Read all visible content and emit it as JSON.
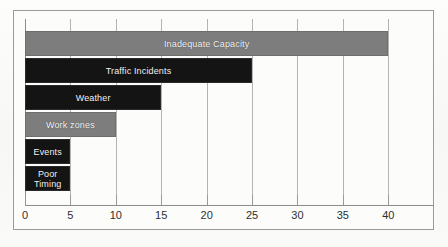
{
  "chart_data": {
    "type": "bar",
    "orientation": "horizontal",
    "title": "",
    "xlabel": "",
    "ylabel": "",
    "xlim": [
      0,
      42.5
    ],
    "grid": true,
    "legend": "none",
    "xticks": [
      "0",
      "5",
      "10",
      "15",
      "20",
      "25",
      "30",
      "35",
      "40"
    ],
    "xtick_values": [
      0,
      5,
      10,
      15,
      20,
      25,
      30,
      35,
      40
    ],
    "categories": [
      "Inadequate Capacity",
      "Traffic Incidents",
      "Weather",
      "Work zones",
      "Events",
      "Poor Timing"
    ],
    "values": [
      40,
      25,
      15,
      10,
      5,
      5
    ],
    "bars": [
      {
        "label": "Inadequate Capacity",
        "display_label": "Inadequate Capacity",
        "value": 40,
        "color": "#7d7d7d",
        "style": "gray"
      },
      {
        "label": "Traffic Incidents",
        "display_label": "Traffic Incidents",
        "value": 25,
        "color": "#141414",
        "style": "dark"
      },
      {
        "label": "Weather",
        "display_label": "Weather",
        "value": 15,
        "color": "#141414",
        "style": "dark"
      },
      {
        "label": "Work zones",
        "display_label": "Work zones",
        "value": 10,
        "color": "#7d7d7d",
        "style": "gray"
      },
      {
        "label": "Events",
        "display_label": "Events",
        "value": 5,
        "color": "#141414",
        "style": "dark"
      },
      {
        "label": "Poor Timing",
        "display_label": "Poor\nTiming",
        "value": 5,
        "color": "#141414",
        "style": "dark"
      }
    ],
    "colors": {
      "gray_bar": "#7d7d7d",
      "dark_bar": "#141414",
      "gridline": "#b4b4b2",
      "axis": "#8d8d8b",
      "frame": "#9a9a97",
      "tick_text": "#2e2e2e",
      "bar_text": "#f2f2f2",
      "background": "#fcfcfb"
    }
  }
}
